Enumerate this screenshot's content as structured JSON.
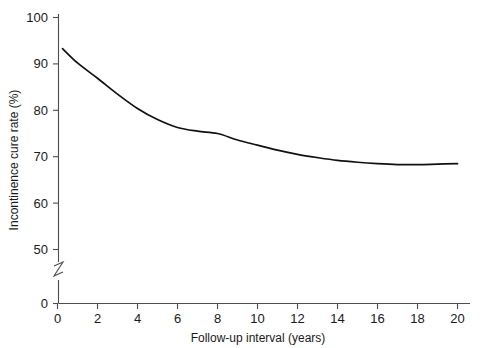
{
  "chart_data": {
    "type": "line",
    "title": "",
    "subtitle": "",
    "xlabel": "Follow-up interval (years)",
    "ylabel": "Incontinence cure rate (%)",
    "xlim": [
      0,
      20
    ],
    "ylim": [
      0,
      100
    ],
    "y_axis_break": true,
    "y_axis_break_between": [
      0,
      50
    ],
    "grid": false,
    "legend": null,
    "xticks": [
      0,
      2,
      4,
      6,
      8,
      10,
      12,
      14,
      16,
      18,
      20
    ],
    "xtick_labels": [
      "0",
      "2",
      "4",
      "6",
      "8",
      "10",
      "12",
      "14",
      "16",
      "18",
      "20"
    ],
    "yticks": [
      0,
      50,
      60,
      70,
      80,
      90,
      100
    ],
    "ytick_labels": [
      "0",
      "50",
      "60",
      "70",
      "80",
      "90",
      "100"
    ],
    "series": [
      {
        "name": "Incontinence cure rate",
        "color": "#111111",
        "x": [
          0.25,
          1,
          2,
          3,
          4,
          5,
          6,
          7,
          8,
          9,
          10,
          11,
          12,
          13,
          14,
          15,
          16,
          17,
          18,
          19,
          20
        ],
        "values": [
          93.3,
          90.2,
          86.9,
          83.5,
          80.4,
          78.0,
          76.3,
          75.5,
          75.0,
          73.6,
          72.5,
          71.4,
          70.5,
          69.8,
          69.2,
          68.8,
          68.5,
          68.3,
          68.3,
          68.4,
          68.5
        ]
      }
    ],
    "annotations": []
  },
  "axes": {
    "x_title": "Follow-up interval (years)",
    "y_title": "Incontinence cure rate (%)"
  },
  "colors": {
    "curve": "#111111",
    "axis": "#4d4d4d",
    "text": "#1a1a1a",
    "background": "#ffffff"
  }
}
